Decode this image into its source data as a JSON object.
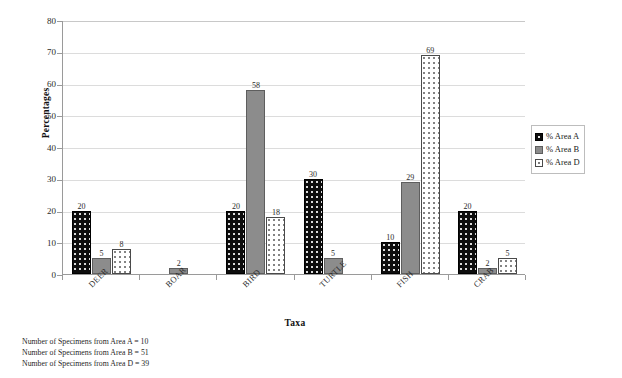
{
  "chart_data": {
    "type": "bar",
    "title": "",
    "xlabel": "Taxa",
    "ylabel": "Percentages",
    "ylim": [
      0,
      80
    ],
    "yticks": [
      0,
      10,
      20,
      30,
      40,
      50,
      60,
      70,
      80
    ],
    "grid": true,
    "legend_position": "right",
    "categories": [
      "DEER",
      "BOAR",
      "BIRD",
      "TURTLE",
      "FISH",
      "CRAB"
    ],
    "series": [
      {
        "name": "% Area A",
        "key": "a",
        "color": "#0d0d0d",
        "pattern": "black-dotted",
        "values": [
          20,
          null,
          20,
          30,
          10,
          20
        ]
      },
      {
        "name": "% Area B",
        "key": "b",
        "color": "#8c8c8c",
        "pattern": "solid-gray",
        "values": [
          5,
          2,
          58,
          5,
          29,
          2
        ]
      },
      {
        "name": "% Area D",
        "key": "d",
        "color": "#ffffff",
        "pattern": "white-dotted",
        "values": [
          8,
          null,
          18,
          null,
          69,
          5
        ]
      }
    ],
    "bar_labels": {
      "deer": [
        "20",
        "5",
        "8"
      ],
      "boar": [
        "",
        "2",
        ""
      ],
      "bird": [
        "20",
        "58",
        "18"
      ],
      "turtle": [
        "30",
        "5",
        ""
      ],
      "fish": [
        "10",
        "29",
        "69"
      ],
      "crab": [
        "20",
        "2",
        "5"
      ]
    }
  },
  "axes": {
    "y_title": "Percentages",
    "x_title": "Taxa",
    "y_tick_labels": [
      "80",
      "70",
      "60",
      "50",
      "40",
      "30",
      "20",
      "10",
      "0"
    ],
    "x_tick_labels": [
      "DEER",
      "BOAR",
      "BIRD",
      "TURTLE",
      "FISH",
      "CRAB"
    ]
  },
  "legend": {
    "items": [
      {
        "label": "% Area A"
      },
      {
        "label": "% Area B"
      },
      {
        "label": "% Area D"
      }
    ]
  },
  "footnotes": [
    "Number of Specimens from Area A = 10",
    "Number of Specimens from Area B = 51",
    "Number of Specimens from Area D = 39"
  ]
}
